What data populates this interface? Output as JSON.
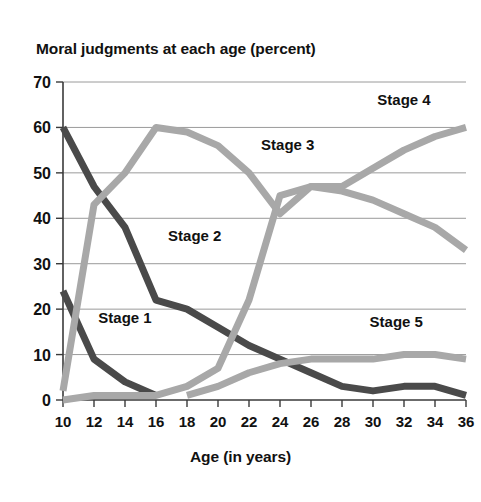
{
  "chart_data": {
    "type": "line",
    "title": "Moral judgments at each age (percent)",
    "xlabel": "Age (in years)",
    "ylabel": "",
    "xlim": [
      10,
      36
    ],
    "ylim": [
      0,
      70
    ],
    "grid": true,
    "legend_position": "inline-labels",
    "x_ticks": [
      10,
      12,
      14,
      16,
      18,
      20,
      22,
      24,
      26,
      28,
      30,
      32,
      34,
      36
    ],
    "y_ticks": [
      0,
      10,
      20,
      30,
      40,
      50,
      60,
      70
    ],
    "x": [
      10,
      12,
      14,
      16,
      18,
      20,
      22,
      24,
      26,
      28,
      30,
      32,
      34,
      36
    ],
    "series": [
      {
        "name": "Stage 1",
        "color": "#4a4a4a",
        "label_x": 14,
        "label_y": 17,
        "values": [
          24,
          9,
          4,
          1,
          null,
          null,
          null,
          null,
          null,
          null,
          null,
          null,
          null,
          null
        ]
      },
      {
        "name": "Stage 2",
        "color": "#4a4a4a",
        "label_x": 18.5,
        "label_y": 35,
        "values": [
          60,
          47,
          38,
          22,
          20,
          16,
          12,
          9,
          6,
          3,
          2,
          3,
          3,
          1
        ]
      },
      {
        "name": "Stage 3",
        "color": "#a8a8a8",
        "label_x": 24.5,
        "label_y": 55,
        "values": [
          2,
          43,
          50,
          60,
          59,
          56,
          50,
          41,
          47,
          46,
          44,
          41,
          38,
          33
        ]
      },
      {
        "name": "Stage 4",
        "color": "#a8a8a8",
        "label_x": 32,
        "label_y": 65,
        "values": [
          0,
          1,
          1,
          1,
          3,
          7,
          22,
          45,
          47,
          47,
          51,
          55,
          58,
          60
        ]
      },
      {
        "name": "Stage 5",
        "color": "#a8a8a8",
        "label_x": 31.5,
        "label_y": 16,
        "values": [
          null,
          null,
          null,
          null,
          1,
          3,
          6,
          8,
          9,
          9,
          9,
          10,
          10,
          9
        ]
      }
    ]
  }
}
